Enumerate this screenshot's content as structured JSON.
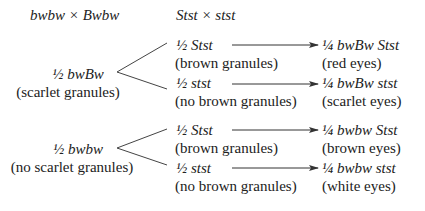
{
  "header": {
    "cross_bw": "bwbw × Bwbw",
    "cross_st": "Stst × stst"
  },
  "groups": [
    {
      "genotype": "½ bwBw",
      "phenotype": "(scarlet granules)",
      "branches": [
        {
          "genotype": "½ Stst",
          "phenotype": "(brown granules)",
          "result_genotype": "¼ bwBw Stst",
          "result_phenotype": "(red eyes)"
        },
        {
          "genotype": "½ stst",
          "phenotype": "(no brown granules)",
          "result_genotype": "¼ bwBw stst",
          "result_phenotype": "(scarlet eyes)"
        }
      ]
    },
    {
      "genotype": "½ bwbw",
      "phenotype": "(no scarlet granules)",
      "branches": [
        {
          "genotype": "½ Stst",
          "phenotype": "(brown granules)",
          "result_genotype": "¼ bwbw Stst",
          "result_phenotype": "(brown eyes)"
        },
        {
          "genotype": "½ stst",
          "phenotype": "(no brown granules)",
          "result_genotype": "¼ bwbw stst",
          "result_phenotype": "(white eyes)"
        }
      ]
    }
  ],
  "colors": {
    "text": "#222222",
    "lines": "#333333",
    "background": "#ffffff"
  }
}
